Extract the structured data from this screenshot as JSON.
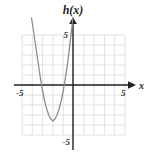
{
  "figure": {
    "name": "parabola-graph",
    "function_label": "h(x)",
    "x_axis_label": "x",
    "background_color": "#ffffff",
    "grid_color": "#d9d9d9",
    "axis_color": "#231f20",
    "curve_color": "#8c8c8c"
  },
  "labels": {
    "y_axis_top_tick": "5",
    "y_axis_bottom_tick": "-5",
    "x_axis_left_tick": "-5",
    "x_axis_right_tick": "5"
  },
  "chart_data": {
    "type": "line",
    "title": "h(x)",
    "xlabel": "x",
    "ylabel": "h(x)",
    "xlim": [
      -5,
      5
    ],
    "ylim": [
      -5,
      5
    ],
    "grid": true,
    "grid_step": 1,
    "legend": "none",
    "series": [
      {
        "name": "h(x)",
        "equation": "h(x) = x^2 + 2x - 2.6",
        "vertex": [
          -1,
          -3.6
        ],
        "x_intercepts": [
          -2.9,
          0.9
        ],
        "y_intercept": -2.6,
        "opens": "up",
        "x": [
          -3.4,
          -3.2,
          -3.0,
          -2.8,
          -2.6,
          -2.4,
          -2.2,
          -2.0,
          -1.8,
          -1.6,
          -1.4,
          -1.2,
          -1.0,
          -0.8,
          -0.6,
          -0.4,
          -0.2,
          0.0,
          0.2,
          0.4,
          0.6,
          0.8,
          1.0,
          1.2,
          1.4
        ],
        "y": [
          2.0,
          0.6,
          -0.6,
          -1.6,
          -2.4,
          -3.0,
          -3.4,
          -3.6,
          -3.4,
          -3.0,
          -2.4,
          -1.6,
          -0.6,
          0.6,
          2.0,
          3.6,
          5.4,
          7.4,
          9.6,
          12.0,
          14.6,
          17.4,
          20.4,
          23.6,
          27.0
        ]
      }
    ],
    "xticks": [
      -5,
      5
    ],
    "yticks": [
      -5,
      5
    ],
    "xtick_labels": [
      "-5",
      "5"
    ],
    "ytick_labels": [
      "-5",
      "5"
    ]
  }
}
